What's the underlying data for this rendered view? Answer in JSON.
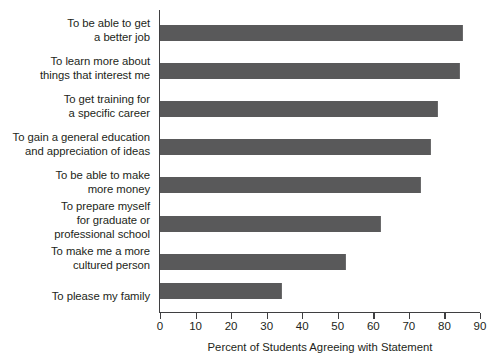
{
  "chart_data": {
    "type": "bar",
    "orientation": "horizontal",
    "title": "",
    "xlabel": "Percent of Students Agreeing with Statement",
    "ylabel": "",
    "xlim": [
      0,
      90
    ],
    "xticks": [
      0,
      10,
      20,
      30,
      40,
      50,
      60,
      70,
      80,
      90
    ],
    "grid": false,
    "legend": false,
    "bar_color": "#59595a",
    "axis_color": "#3f3f41",
    "text_color": "#231f20",
    "categories": [
      "To be able to get\na better job",
      "To learn more about\nthings that interest me",
      "To get training for\na specific career",
      "To gain a general education\nand appreciation of ideas",
      "To be able to make\nmore money",
      "To prepare myself\nfor graduate or\nprofessional school",
      "To make me a more\ncultured person",
      "To please my family"
    ],
    "values": [
      85,
      84,
      78,
      76,
      73,
      62,
      52,
      34
    ]
  }
}
